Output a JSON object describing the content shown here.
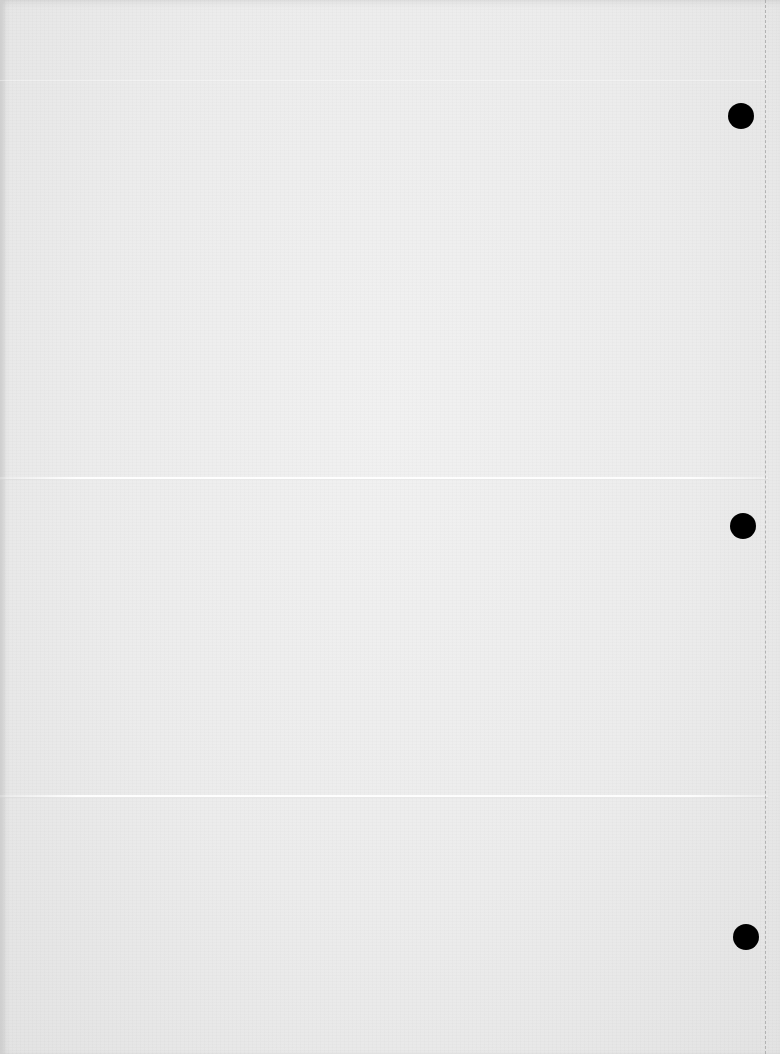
{
  "document": {
    "type": "blank scanned sheet",
    "text_content": "",
    "paper_color": "#ececec",
    "punch_holes": [
      {
        "cx": 741,
        "cy": 116,
        "r": 13
      },
      {
        "cx": 743,
        "cy": 526,
        "r": 13
      },
      {
        "cx": 746,
        "cy": 937,
        "r": 13
      }
    ],
    "fold_lines_y": [
      478,
      796
    ],
    "faint_line_y": 80,
    "perforation_x": 765,
    "hole_color": "#000000"
  }
}
